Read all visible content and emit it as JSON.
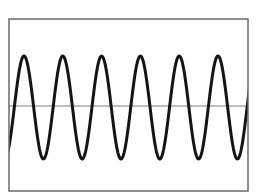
{
  "figure": {
    "type": "waveform",
    "frame": {
      "x": 9,
      "y": 19,
      "width": 239,
      "height": 172,
      "stroke": "#6a6a6a",
      "stroke_width": 1.5
    },
    "baseline": {
      "y": 106,
      "stroke": "#7a7a7a",
      "stroke_width": 1
    },
    "wave": {
      "stroke": "#141414",
      "stroke_width": 3,
      "center_y": 107.5,
      "amplitude": 51.5,
      "period": 38.8,
      "first_peak_x": 24,
      "cycles_visible": 6,
      "peaks_x": [
        24,
        62,
        101,
        140,
        178,
        218
      ],
      "troughs_x": [
        43,
        81,
        120,
        160,
        198,
        238
      ]
    }
  },
  "chart_data": {
    "type": "line",
    "title": "",
    "xlabel": "",
    "ylabel": "",
    "series": [
      {
        "name": "sine wave",
        "function": "y = A*sin(2*pi*x/P)",
        "amplitude": 1,
        "cycles": 6
      }
    ],
    "grid": false,
    "legend": null
  }
}
